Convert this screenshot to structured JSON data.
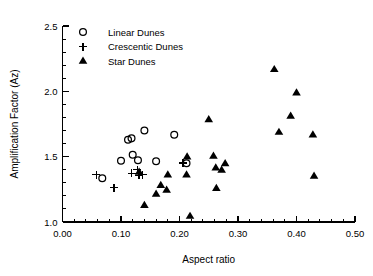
{
  "chart_data": {
    "type": "scatter",
    "title": "",
    "xlabel": "Aspect ratio",
    "ylabel": "Amplification Factor (Az)",
    "xlim": [
      0.0,
      0.5
    ],
    "ylim": [
      1.0,
      2.5
    ],
    "xticks": [
      0.0,
      0.1,
      0.2,
      0.3,
      0.4,
      0.5
    ],
    "xticklabels": [
      "0.00",
      "0.10",
      "0.20",
      "0.30",
      "0.40",
      "0.50"
    ],
    "yticks": [
      1.0,
      1.5,
      2.0,
      2.5
    ],
    "yticklabels": [
      "1.0",
      "1.5",
      "2.0",
      "2.5"
    ],
    "x_minor_step": 0.02,
    "y_minor_step": 0.1,
    "grid": false,
    "legend_position": "top-left",
    "series": [
      {
        "name": "Linear Dunes",
        "marker": "circle-open",
        "points": [
          [
            0.068,
            1.335
          ],
          [
            0.1,
            1.468
          ],
          [
            0.112,
            1.63
          ],
          [
            0.118,
            1.64
          ],
          [
            0.12,
            1.515
          ],
          [
            0.129,
            1.472
          ],
          [
            0.14,
            1.7
          ],
          [
            0.16,
            1.465
          ],
          [
            0.191,
            1.668
          ],
          [
            0.212,
            1.45
          ]
        ]
      },
      {
        "name": "Crescentic Dunes",
        "marker": "plus",
        "points": [
          [
            0.058,
            1.362
          ],
          [
            0.088,
            1.262
          ],
          [
            0.118,
            1.372
          ],
          [
            0.128,
            1.4
          ],
          [
            0.131,
            1.358
          ],
          [
            0.137,
            1.362
          ],
          [
            0.206,
            1.452
          ]
        ]
      },
      {
        "name": "Star Dunes",
        "marker": "triangle-filled",
        "points": [
          [
            0.131,
            1.382
          ],
          [
            0.14,
            1.128
          ],
          [
            0.16,
            1.215
          ],
          [
            0.168,
            1.282
          ],
          [
            0.178,
            1.245
          ],
          [
            0.18,
            1.362
          ],
          [
            0.212,
            1.362
          ],
          [
            0.213,
            1.5
          ],
          [
            0.218,
            1.045
          ],
          [
            0.25,
            1.785
          ],
          [
            0.258,
            1.505
          ],
          [
            0.262,
            1.415
          ],
          [
            0.263,
            1.258
          ],
          [
            0.272,
            1.398
          ],
          [
            0.278,
            1.448
          ],
          [
            0.362,
            2.168
          ],
          [
            0.37,
            1.688
          ],
          [
            0.39,
            1.812
          ],
          [
            0.4,
            1.99
          ],
          [
            0.428,
            1.668
          ],
          [
            0.43,
            1.352
          ]
        ]
      }
    ]
  },
  "legend": {
    "entries": [
      {
        "label": "Linear Dunes",
        "marker": "circle-open"
      },
      {
        "label": "Crescentic Dunes",
        "marker": "plus"
      },
      {
        "label": "Star Dunes",
        "marker": "triangle-filled"
      }
    ]
  }
}
